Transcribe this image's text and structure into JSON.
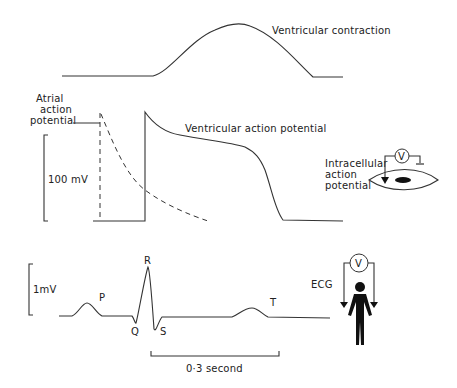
{
  "diagram": {
    "contraction": {
      "label": "Ventricular contraction"
    },
    "action_potentials": {
      "atrial_label_line1": "Atrial",
      "atrial_label_line2": "action",
      "atrial_label_line3": "potential",
      "ventricular_label": "Ventricular action potential",
      "scale_label": "100 mV",
      "intracellular_line1": "Intracellular",
      "intracellular_line2": "action",
      "intracellular_line3": "potential",
      "voltmeter_symbol": "V"
    },
    "ecg": {
      "scale_label": "1mV",
      "wave_labels": {
        "p": "P",
        "q": "Q",
        "r": "R",
        "s": "S",
        "t": "T"
      },
      "ecg_label": "ECG",
      "voltmeter_symbol": "V",
      "time_scale_label": "0·3 second"
    }
  }
}
